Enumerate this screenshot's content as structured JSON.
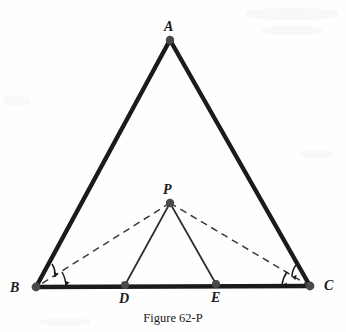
{
  "figure": {
    "caption": "Figure 62-P",
    "background_color": "#fefefe",
    "ink_color": "#1b1b1b",
    "vertex_dot_color": "#4a4a4a"
  },
  "labels": {
    "a": "A",
    "b": "B",
    "c": "C",
    "d": "D",
    "e": "E",
    "p": "P"
  },
  "geometry": {
    "type": "euclidean-plane-figure",
    "description": "Isosceles triangle ABC with apex A, base BC; interior point P above base; D and E on base BC; segments PD and PE drawn solid thin; segments PB and PC drawn dashed; angle arcs at B and C indicate bisected base angles.",
    "points": {
      "A": {
        "x": 170,
        "y": 40
      },
      "B": {
        "x": 36,
        "y": 287
      },
      "C": {
        "x": 310,
        "y": 286
      },
      "D": {
        "x": 125,
        "y": 285
      },
      "E": {
        "x": 216,
        "y": 284
      },
      "P": {
        "x": 170,
        "y": 203
      }
    },
    "label_offsets": {
      "A": {
        "x": 164,
        "y": 20
      },
      "B": {
        "x": 10,
        "y": 281
      },
      "C": {
        "x": 324,
        "y": 279
      },
      "D": {
        "x": 119,
        "y": 292
      },
      "E": {
        "x": 211,
        "y": 291
      },
      "P": {
        "x": 163,
        "y": 183
      }
    },
    "segments": [
      {
        "name": "side-AB",
        "from": "A",
        "to": "B",
        "style": "solid",
        "weight": "thick"
      },
      {
        "name": "side-AC",
        "from": "A",
        "to": "C",
        "style": "solid",
        "weight": "thick"
      },
      {
        "name": "base-BC",
        "from": "B",
        "to": "C",
        "style": "solid",
        "weight": "thick"
      },
      {
        "name": "segment-PD",
        "from": "P",
        "to": "D",
        "style": "solid",
        "weight": "thin"
      },
      {
        "name": "segment-PE",
        "from": "P",
        "to": "E",
        "style": "solid",
        "weight": "thin"
      },
      {
        "name": "segment-PB",
        "from": "P",
        "to": "B",
        "style": "dashed",
        "weight": "thin"
      },
      {
        "name": "segment-PC",
        "from": "P",
        "to": "C",
        "style": "dashed",
        "weight": "thin"
      }
    ],
    "angle_marks": [
      {
        "name": "angle-mark-b-outer",
        "at": "B",
        "count": 2,
        "tipped": true
      },
      {
        "name": "angle-mark-c-outer",
        "at": "C",
        "count": 2,
        "tipped": true
      }
    ]
  }
}
